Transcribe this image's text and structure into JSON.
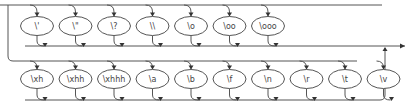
{
  "diagram": {
    "type": "railroad",
    "colors": {
      "line": "#555555",
      "text": "#444444",
      "arrow": "#333333",
      "background": "#ffffff"
    },
    "rows": [
      {
        "name": "row-1",
        "nodes": [
          {
            "label": "\\'",
            "id": "single-quote"
          },
          {
            "label": "\\\"",
            "id": "double-quote"
          },
          {
            "label": "\\?",
            "id": "question-mark"
          },
          {
            "label": "\\\\",
            "id": "backslash"
          },
          {
            "label": "\\o",
            "id": "octal-1"
          },
          {
            "label": "\\oo",
            "id": "octal-2"
          },
          {
            "label": "\\ooo",
            "id": "octal-3"
          }
        ]
      },
      {
        "name": "row-2",
        "nodes": [
          {
            "label": "\\xh",
            "id": "hex-1"
          },
          {
            "label": "\\xhh",
            "id": "hex-2"
          },
          {
            "label": "\\xhhh",
            "id": "hex-3"
          },
          {
            "label": "\\a",
            "id": "alert"
          },
          {
            "label": "\\b",
            "id": "backspace"
          },
          {
            "label": "\\f",
            "id": "form-feed"
          },
          {
            "label": "\\n",
            "id": "newline"
          },
          {
            "label": "\\r",
            "id": "carriage-return"
          },
          {
            "label": "\\t",
            "id": "tab"
          },
          {
            "label": "\\v",
            "id": "vertical-tab"
          }
        ]
      }
    ]
  }
}
